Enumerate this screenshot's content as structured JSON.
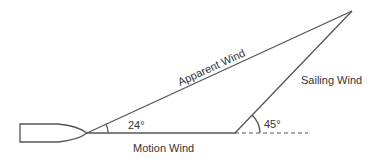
{
  "diagram": {
    "labels": {
      "apparent_wind": "Apparent Wind",
      "sailing_wind": "Sailing Wind",
      "motion_wind": "Motion Wind",
      "angle_apparent": "24°",
      "angle_sailing": "45°"
    },
    "colors": {
      "line": "#555555",
      "text": "#333333",
      "background": "#ffffff"
    }
  }
}
